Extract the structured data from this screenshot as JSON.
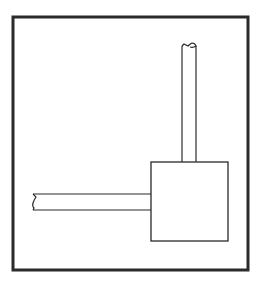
{
  "diagram": {
    "type": "pipe-and-tank schematic",
    "colors": {
      "background": "#ffffff",
      "stroke": "#2a2a2a",
      "frame": "#2b2b2b"
    },
    "frame": {
      "x": 13,
      "y": 17,
      "width": 235,
      "height": 253,
      "stroke_width": 3
    },
    "tank": {
      "x": 151,
      "y": 162,
      "width": 77,
      "height": 79
    },
    "vertical_pipe": {
      "x_left": 182,
      "x_right": 196,
      "y_top": 44,
      "y_bottom": 162,
      "end": "broken"
    },
    "horizontal_pipe": {
      "x_left": 33,
      "x_right": 151,
      "y_top": 194,
      "y_bottom": 210,
      "end": "broken"
    }
  }
}
